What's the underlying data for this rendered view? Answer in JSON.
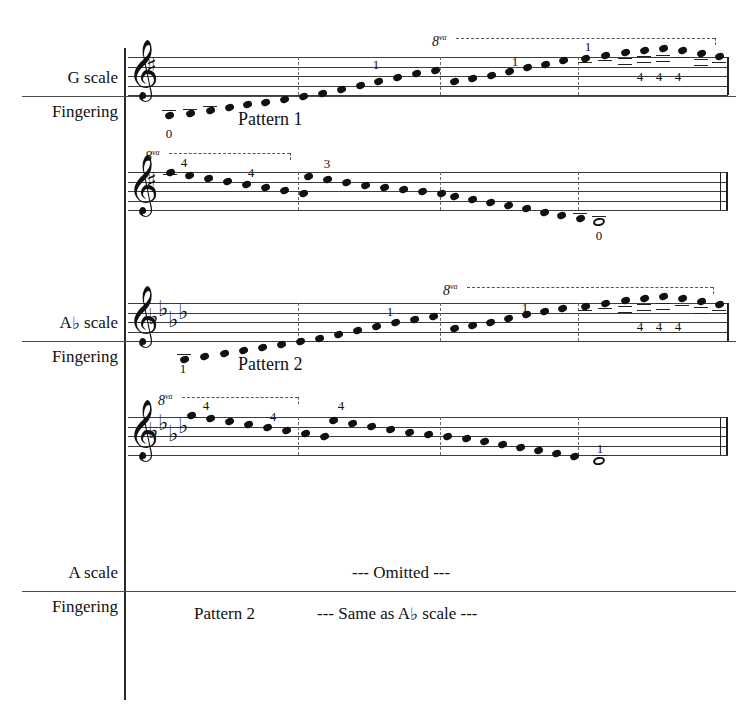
{
  "document": {
    "type": "music-scale-fingering-chart",
    "title_visible": false
  },
  "labels": {
    "g_scale": "G scale",
    "g_fingering": "Fingering",
    "ab_scale_prefix": "A",
    "ab_scale_flat": "♭",
    "ab_scale_suffix": " scale",
    "ab_fingering": "Fingering",
    "a_scale": "A scale",
    "a_fingering": "Fingering"
  },
  "annotations": {
    "pattern1": "Pattern 1",
    "pattern2_ab": "Pattern 2",
    "pattern2_a": "Pattern 2",
    "omitted": "--- Omitted ---",
    "same_as": "--- Same as A♭ scale ---",
    "ottava_label": "8",
    "ottava_sup": "va"
  },
  "systems": [
    {
      "name": "g-scale-ascending",
      "clef": "𝄞",
      "key_signature": {
        "type": "sharp",
        "glyph": "♯",
        "count": 1
      },
      "direction": "ascending",
      "fingerings": [
        {
          "digit": "0",
          "x": 168,
          "y": 127
        },
        {
          "digit": "1",
          "x": 371,
          "y": 58
        },
        {
          "digit": "1",
          "x": 510,
          "y": 55
        },
        {
          "digit": "1",
          "x": 583,
          "y": 44
        },
        {
          "digit": "4",
          "x": 636,
          "y": 72
        },
        {
          "digit": "4",
          "x": 654,
          "y": 72
        },
        {
          "digit": "4",
          "x": 672,
          "y": 72
        }
      ],
      "ottava": {
        "x": 432,
        "y": 34,
        "width": 285
      }
    },
    {
      "name": "g-scale-descending",
      "clef": "𝄞",
      "key_signature": {
        "type": "sharp",
        "glyph": "♯",
        "count": 1
      },
      "direction": "descending",
      "fingerings": [
        {
          "digit": "4",
          "x": 179,
          "y": 158
        },
        {
          "digit": "4",
          "x": 246,
          "y": 167
        },
        {
          "digit": "3",
          "x": 322,
          "y": 158
        },
        {
          "digit": "0",
          "x": 584,
          "y": 228
        }
      ],
      "ottava": {
        "x": 145,
        "y": 149,
        "width": 147
      },
      "final_note": {
        "type": "whole",
        "fingering": "0"
      }
    },
    {
      "name": "ab-scale-ascending",
      "clef": "𝄞",
      "key_signature": {
        "type": "flat",
        "glyph": "♭",
        "count": 4
      },
      "direction": "ascending",
      "fingerings": [
        {
          "digit": "1",
          "x": 183,
          "y": 362
        },
        {
          "digit": "1",
          "x": 385,
          "y": 307
        },
        {
          "digit": "1",
          "x": 520,
          "y": 303
        },
        {
          "digit": "4",
          "x": 636,
          "y": 322
        },
        {
          "digit": "4",
          "x": 654,
          "y": 322
        },
        {
          "digit": "4",
          "x": 672,
          "y": 322
        }
      ],
      "ottava": {
        "x": 443,
        "y": 283,
        "width": 272
      }
    },
    {
      "name": "ab-scale-descending",
      "clef": "𝄞",
      "key_signature": {
        "type": "flat",
        "glyph": "♭",
        "count": 4
      },
      "direction": "descending",
      "fingerings": [
        {
          "digit": "4",
          "x": 201,
          "y": 399
        },
        {
          "digit": "4",
          "x": 268,
          "y": 411
        },
        {
          "digit": "4",
          "x": 336,
          "y": 399
        },
        {
          "digit": "1",
          "x": 598,
          "y": 443
        }
      ],
      "ottava": {
        "x": 158,
        "y": 393,
        "width": 142
      },
      "final_note": {
        "type": "whole",
        "fingering": "1"
      }
    }
  ],
  "colors": {
    "ink": "#111111",
    "staff_line": "#3b3b3b",
    "rule": "#4a4a4a",
    "paper": "#ffffff"
  }
}
